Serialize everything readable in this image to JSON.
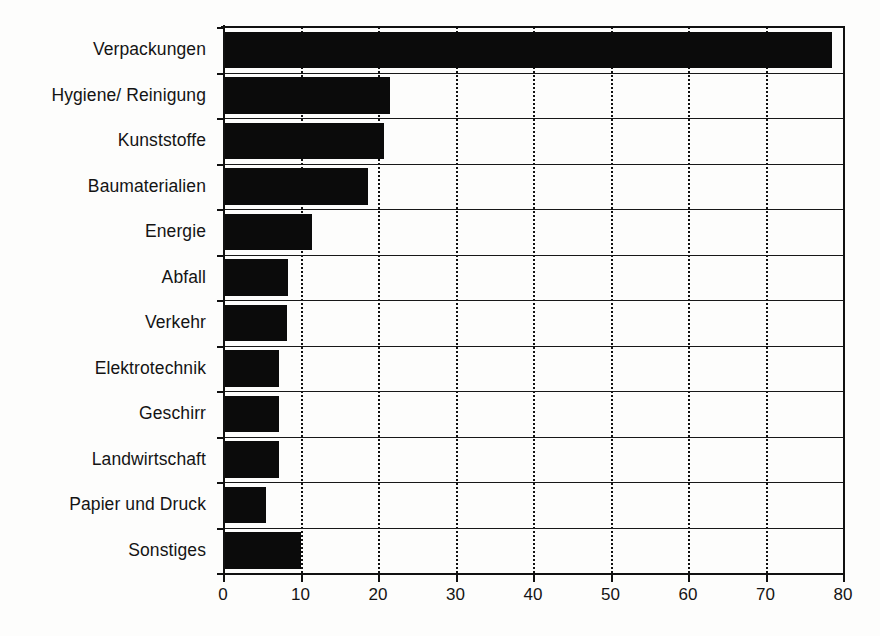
{
  "chart_data": {
    "type": "bar",
    "orientation": "horizontal",
    "title": "",
    "subtitle": "",
    "xlabel": "",
    "ylabel": "",
    "categories": [
      "Verpackungen",
      "Hygiene/ Reinigung",
      "Kunststoffe",
      "Baumaterialien",
      "Energie",
      "Abfall",
      "Verkehr",
      "Elektrotechnik",
      "Geschirr",
      "Landwirtschaft",
      "Papier und Druck",
      "Sonstiges"
    ],
    "values": [
      78.6,
      21.5,
      20.8,
      18.7,
      11.5,
      8.4,
      8.3,
      7.2,
      7.2,
      7.2,
      5.5,
      10.0
    ],
    "xlim": [
      0,
      80
    ],
    "xticks": [
      0,
      10,
      20,
      30,
      40,
      50,
      60,
      70,
      80
    ],
    "xticklabels": [
      "0",
      "10",
      "20",
      "30",
      "40",
      "50",
      "60",
      "70",
      "80"
    ],
    "grid": "vertical-dotted",
    "legend": "none",
    "bar_color": "#0b0b0b",
    "background_color": "#fdfdfc",
    "axis_color": "#111111"
  }
}
